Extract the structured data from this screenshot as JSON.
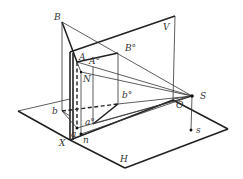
{
  "figure": {
    "labels": {
      "B": "B",
      "A": "A",
      "A0": "A°",
      "B0": "B°",
      "N": "N",
      "V": "V",
      "S": "S",
      "O": "O",
      "s": "s",
      "b": "b",
      "b0": "b°",
      "a0": "a°",
      "a": "a",
      "n": "n",
      "X": "X",
      "H": "H"
    },
    "colors": {
      "line": "#222222",
      "background": "#ffffff"
    }
  }
}
